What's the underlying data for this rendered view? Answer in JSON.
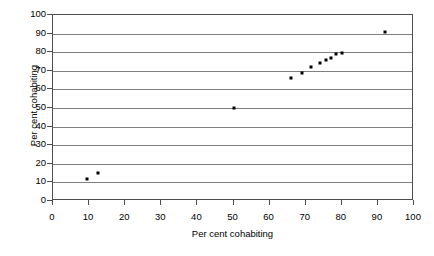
{
  "chart_data": {
    "type": "scatter",
    "title": "",
    "xlabel": "Per cent cohabiting",
    "ylabel": "Per cent cohabiting",
    "xlim": [
      0,
      100
    ],
    "ylim": [
      0,
      100
    ],
    "xticks": [
      0,
      10,
      20,
      30,
      40,
      50,
      60,
      70,
      80,
      90,
      100
    ],
    "yticks": [
      0,
      10,
      20,
      30,
      40,
      50,
      60,
      70,
      80,
      90,
      100
    ],
    "grid": "horizontal",
    "legend": "none",
    "marker_color": "#000000",
    "gridline_color": "#7f7f7f",
    "axis_color": "#4d4d4d",
    "points": [
      {
        "x": 9.5,
        "y": 12
      },
      {
        "x": 12.5,
        "y": 15
      },
      {
        "x": 50,
        "y": 50
      },
      {
        "x": 66,
        "y": 66
      },
      {
        "x": 69,
        "y": 69
      },
      {
        "x": 71.5,
        "y": 72
      },
      {
        "x": 74,
        "y": 74
      },
      {
        "x": 75.5,
        "y": 76
      },
      {
        "x": 77,
        "y": 77
      },
      {
        "x": 78.5,
        "y": 79
      },
      {
        "x": 80,
        "y": 79.5
      },
      {
        "x": 92,
        "y": 91
      }
    ]
  }
}
